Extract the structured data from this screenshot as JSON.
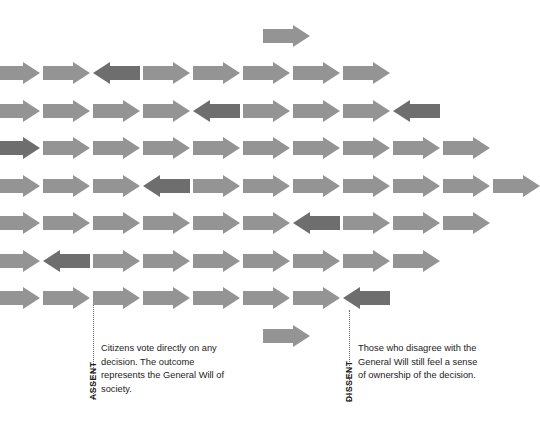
{
  "figure": {
    "title_visible": false,
    "background_color": "#ffffff",
    "arrow_light_color": "#949494",
    "arrow_dark_color": "#6e6e6e",
    "callout_line_color": "#6b6b6b",
    "text_color": "#1c1c1c"
  },
  "chart_data": {
    "type": "diagram",
    "arrow_width_px": 47,
    "arrow_height_px": 22,
    "column_pitch_px": 50,
    "row_pitch_px": 37.5,
    "rows": [
      {
        "row": 1,
        "y": 25,
        "start_x": 263,
        "arrows": [
          {
            "dir": "right",
            "tone": "light"
          }
        ]
      },
      {
        "row": 2,
        "y": 62,
        "start_x": -7,
        "arrows": [
          {
            "dir": "right",
            "tone": "light"
          },
          {
            "dir": "right",
            "tone": "light"
          },
          {
            "dir": "left",
            "tone": "dark"
          },
          {
            "dir": "right",
            "tone": "light"
          },
          {
            "dir": "right",
            "tone": "light"
          },
          {
            "dir": "right",
            "tone": "light"
          },
          {
            "dir": "right",
            "tone": "light"
          },
          {
            "dir": "right",
            "tone": "light"
          }
        ]
      },
      {
        "row": 3,
        "y": 100,
        "start_x": -7,
        "arrows": [
          {
            "dir": "right",
            "tone": "light"
          },
          {
            "dir": "right",
            "tone": "light"
          },
          {
            "dir": "right",
            "tone": "light"
          },
          {
            "dir": "right",
            "tone": "light"
          },
          {
            "dir": "left",
            "tone": "dark"
          },
          {
            "dir": "right",
            "tone": "light"
          },
          {
            "dir": "right",
            "tone": "light"
          },
          {
            "dir": "right",
            "tone": "light"
          },
          {
            "dir": "left",
            "tone": "dark"
          }
        ]
      },
      {
        "row": 4,
        "y": 137,
        "start_x": -7,
        "arrows": [
          {
            "dir": "right",
            "tone": "dark"
          },
          {
            "dir": "right",
            "tone": "light"
          },
          {
            "dir": "right",
            "tone": "light"
          },
          {
            "dir": "right",
            "tone": "light"
          },
          {
            "dir": "right",
            "tone": "light"
          },
          {
            "dir": "right",
            "tone": "light"
          },
          {
            "dir": "right",
            "tone": "light"
          },
          {
            "dir": "right",
            "tone": "light"
          },
          {
            "dir": "right",
            "tone": "light"
          },
          {
            "dir": "right",
            "tone": "light"
          }
        ]
      },
      {
        "row": 5,
        "y": 175,
        "start_x": -7,
        "arrows": [
          {
            "dir": "right",
            "tone": "light"
          },
          {
            "dir": "right",
            "tone": "light"
          },
          {
            "dir": "right",
            "tone": "light"
          },
          {
            "dir": "left",
            "tone": "dark"
          },
          {
            "dir": "right",
            "tone": "light"
          },
          {
            "dir": "right",
            "tone": "light"
          },
          {
            "dir": "right",
            "tone": "light"
          },
          {
            "dir": "right",
            "tone": "light"
          },
          {
            "dir": "right",
            "tone": "light"
          },
          {
            "dir": "right",
            "tone": "light"
          },
          {
            "dir": "right",
            "tone": "light"
          }
        ]
      },
      {
        "row": 6,
        "y": 212,
        "start_x": -7,
        "arrows": [
          {
            "dir": "right",
            "tone": "light"
          },
          {
            "dir": "right",
            "tone": "light"
          },
          {
            "dir": "right",
            "tone": "light"
          },
          {
            "dir": "right",
            "tone": "light"
          },
          {
            "dir": "right",
            "tone": "light"
          },
          {
            "dir": "right",
            "tone": "light"
          },
          {
            "dir": "left",
            "tone": "dark"
          },
          {
            "dir": "right",
            "tone": "light"
          },
          {
            "dir": "right",
            "tone": "light"
          },
          {
            "dir": "right",
            "tone": "light"
          }
        ]
      },
      {
        "row": 7,
        "y": 250,
        "start_x": -7,
        "arrows": [
          {
            "dir": "right",
            "tone": "light"
          },
          {
            "dir": "left",
            "tone": "dark"
          },
          {
            "dir": "right",
            "tone": "light"
          },
          {
            "dir": "right",
            "tone": "light"
          },
          {
            "dir": "right",
            "tone": "light"
          },
          {
            "dir": "right",
            "tone": "light"
          },
          {
            "dir": "right",
            "tone": "light"
          },
          {
            "dir": "right",
            "tone": "light"
          },
          {
            "dir": "right",
            "tone": "light"
          }
        ]
      },
      {
        "row": 8,
        "y": 287,
        "start_x": -7,
        "arrows": [
          {
            "dir": "right",
            "tone": "light"
          },
          {
            "dir": "right",
            "tone": "light"
          },
          {
            "dir": "right",
            "tone": "light"
          },
          {
            "dir": "right",
            "tone": "light"
          },
          {
            "dir": "right",
            "tone": "light"
          },
          {
            "dir": "right",
            "tone": "light"
          },
          {
            "dir": "right",
            "tone": "light"
          },
          {
            "dir": "left",
            "tone": "dark"
          }
        ]
      },
      {
        "row": 9,
        "y": 325,
        "start_x": 263,
        "arrows": [
          {
            "dir": "right",
            "tone": "light"
          }
        ]
      }
    ]
  },
  "callouts": [
    {
      "id": "assent",
      "label": "ASSENT",
      "body": "Citizens vote directly on any decision. The outcome represents the General Will of society.",
      "line_x": 93,
      "line_top": 305,
      "line_height": 95,
      "label_x": 88,
      "label_y": 400,
      "text_x": 101,
      "text_y": 342
    },
    {
      "id": "dissent",
      "label": "DISSENT",
      "body": "Those who disagree with the General Will still feel a sense of ownership of the decision.",
      "line_x": 349,
      "line_top": 310,
      "line_height": 92,
      "label_x": 344,
      "label_y": 402,
      "text_x": 358,
      "text_y": 342
    }
  ]
}
